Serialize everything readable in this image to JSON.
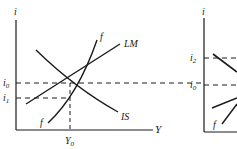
{
  "left_panel": {
    "y_axis_label": "i",
    "x_axis_label": "Y",
    "tick_labels": {
      "i0": "i",
      "i0_sub": "0",
      "i1": "i",
      "i1_sub": "1",
      "Y0": "Y",
      "Y0_sub": "0"
    },
    "curves": {
      "LM": "LM",
      "IS": "IS",
      "f_top": "f",
      "f_bottom": "f"
    }
  },
  "right_panel": {
    "y_axis_label": "i",
    "tick_labels": {
      "i2": "i",
      "i2_sub": "2",
      "i0": "i",
      "i0_sub": "0"
    },
    "curves": {
      "f": "f"
    }
  },
  "colors": {
    "line": "#1a1a1a",
    "background": "#ffffff"
  }
}
